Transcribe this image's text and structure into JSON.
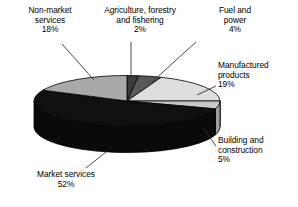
{
  "chart_data": {
    "type": "pie",
    "title": "",
    "subtitle": "",
    "xlabel": "",
    "ylabel": "",
    "legend_position": "callout-labels",
    "grid": false,
    "style": "3d-exploded-disc",
    "units": "percent",
    "total": 100,
    "categories": [
      "Agriculture, forestry and fishering",
      "Fuel and power",
      "Manufactured products",
      "Building and construction",
      "Market services",
      "Non-market services"
    ],
    "values": [
      2,
      4,
      19,
      5,
      52,
      18
    ],
    "slices": [
      {
        "id": "agriculture",
        "name": "Agriculture, forestry and fishering",
        "label_line1": "Agriculture, forestry",
        "label_line2": "and fishering",
        "value": 2,
        "value_label": "2%",
        "color": "#3b3b3b",
        "side_color": "#232323"
      },
      {
        "id": "fuel-and-power",
        "name": "Fuel and power",
        "label_line1": "Fuel and",
        "label_line2": "power",
        "value": 4,
        "value_label": "4%",
        "color": "#585858",
        "side_color": "#383838"
      },
      {
        "id": "manufactured-products",
        "name": "Manufactured products",
        "label_line1": "Manufactured",
        "label_line2": "products",
        "value": 19,
        "value_label": "19%",
        "color": "#dedede",
        "side_color": "#b4b4b4"
      },
      {
        "id": "building-and-construction",
        "name": "Building and construction",
        "label_line1": "Building and",
        "label_line2": "construction",
        "value": 5,
        "value_label": "5%",
        "color": "#c9c9c9",
        "side_color": "#9e9e9e"
      },
      {
        "id": "market-services",
        "name": "Market services",
        "label_line1": "Market services",
        "label_line2": "",
        "value": 52,
        "value_label": "52%",
        "color": "#101010",
        "side_color": "#0a0a0a"
      },
      {
        "id": "non-market-services",
        "name": "Non-market services",
        "label_line1": "Non-market",
        "label_line2": "services",
        "value": 18,
        "value_label": "18%",
        "color": "#a9a9a9",
        "side_color": "#8a8a8a"
      }
    ],
    "outline_color": "#000000",
    "leader_line_color": "#333333",
    "background": "#ffffff"
  }
}
